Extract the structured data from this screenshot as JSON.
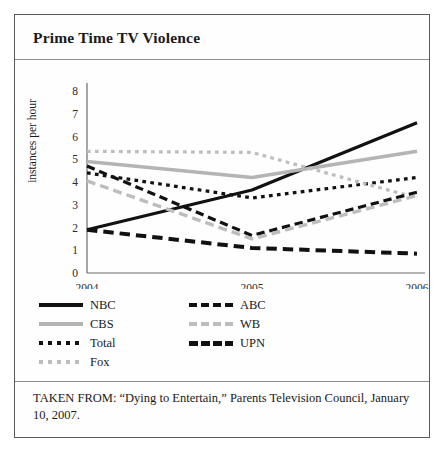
{
  "figure": {
    "title": "Prime Time TV Violence",
    "source": "TAKEN FROM: “Dying to Entertain,” Parents Television Council, January 10, 2007."
  },
  "legend": {
    "items": [
      {
        "label": "NBC",
        "style": "key-solid-black",
        "col": 0,
        "row": 0
      },
      {
        "label": "ABC",
        "style": "key-dash-black",
        "col": 1,
        "row": 0
      },
      {
        "label": "CBS",
        "style": "key-solid-gray",
        "col": 0,
        "row": 1
      },
      {
        "label": "WB",
        "style": "key-dash-gray",
        "col": 1,
        "row": 1
      },
      {
        "label": "Total",
        "style": "key-dot-black",
        "col": 0,
        "row": 2
      },
      {
        "label": "UPN",
        "style": "key-dash-thick",
        "col": 1,
        "row": 2
      },
      {
        "label": "Fox",
        "style": "key-dot-gray",
        "col": 0,
        "row": 3
      }
    ]
  },
  "chart_data": {
    "type": "line",
    "title": "Prime Time TV Violence",
    "xlabel": "",
    "ylabel": "instances per hour",
    "categories": [
      "2004",
      "2005",
      "2006"
    ],
    "x": [
      2004,
      2005,
      2006
    ],
    "ylim": [
      0,
      8
    ],
    "yticks": [
      0,
      1,
      2,
      3,
      4,
      5,
      6,
      7,
      8
    ],
    "grid": false,
    "legend_position": "below-plot",
    "series": [
      {
        "name": "NBC",
        "values": [
          1.9,
          3.65,
          6.6
        ],
        "color": "#111111",
        "dash": "solid",
        "width": 3.2
      },
      {
        "name": "CBS",
        "values": [
          4.9,
          4.2,
          5.35
        ],
        "color": "#b4b4b4",
        "dash": "solid",
        "width": 3.6
      },
      {
        "name": "Total",
        "values": [
          4.4,
          3.3,
          4.2
        ],
        "color": "#111111",
        "dash": "dotted",
        "width": 3.2
      },
      {
        "name": "Fox",
        "values": [
          5.35,
          5.3,
          3.3
        ],
        "color": "#bdbdbd",
        "dash": "dotted",
        "width": 3.2
      },
      {
        "name": "ABC",
        "values": [
          4.7,
          1.65,
          3.55
        ],
        "color": "#111111",
        "dash": "dashed",
        "width": 3.2
      },
      {
        "name": "WB",
        "values": [
          4.05,
          1.5,
          3.4
        ],
        "color": "#bdbdbd",
        "dash": "dashed",
        "width": 3.4
      },
      {
        "name": "UPN",
        "values": [
          1.9,
          1.1,
          0.85
        ],
        "color": "#111111",
        "dash": "dashed",
        "width": 4.0
      }
    ]
  }
}
